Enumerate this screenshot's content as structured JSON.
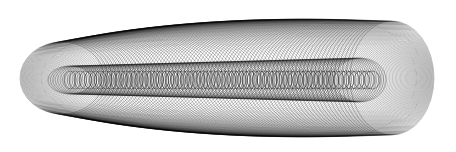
{
  "canvas": {
    "width": 456,
    "height": 152,
    "background": "#ffffff",
    "stroke": "#000000"
  },
  "families": [
    {
      "name": "outer-sweep",
      "count": 140,
      "cx": [
        62,
        392
      ],
      "cy": 78,
      "rx": [
        42,
        42
      ],
      "ry": [
        36,
        57
      ],
      "bulge_rx": 70,
      "bulge_ry": 10,
      "width": 0.45,
      "opacity": 0.55
    },
    {
      "name": "inner-sweep",
      "count": 120,
      "cx": [
        70,
        360
      ],
      "cy": 80,
      "rx": [
        22,
        26
      ],
      "ry": [
        14,
        22
      ],
      "bulge_rx": 0,
      "bulge_ry": 0,
      "width": 0.45,
      "opacity": 0.6
    },
    {
      "name": "core-rings",
      "count": 60,
      "cx": [
        70,
        372
      ],
      "cy": 80,
      "rx": [
        6,
        8
      ],
      "ry": [
        9,
        9
      ],
      "bulge_rx": 0,
      "bulge_ry": 0,
      "width": 0.5,
      "opacity": 0.7
    }
  ]
}
